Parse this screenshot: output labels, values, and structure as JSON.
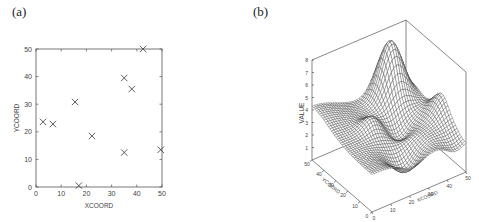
{
  "panels": {
    "a": {
      "label": "(a)"
    },
    "b": {
      "label": "(b)"
    }
  },
  "chart_data": [
    {
      "type": "scatter",
      "panel": "(a)",
      "title": "",
      "xlabel": "XCOORD",
      "ylabel": "YCOORD",
      "xlim": [
        0,
        50
      ],
      "ylim": [
        0,
        50
      ],
      "xticks": [
        "0",
        "10",
        "20",
        "30",
        "40",
        "50"
      ],
      "yticks": [
        "0",
        "10",
        "20",
        "30",
        "40",
        "50"
      ],
      "marker": "x",
      "grid": false,
      "points": [
        {
          "x": 2.8,
          "y": 23.6
        },
        {
          "x": 6.7,
          "y": 22.8
        },
        {
          "x": 15.5,
          "y": 30.8
        },
        {
          "x": 17.0,
          "y": 0.5
        },
        {
          "x": 22.2,
          "y": 18.5
        },
        {
          "x": 35.0,
          "y": 39.5
        },
        {
          "x": 35.0,
          "y": 12.5
        },
        {
          "x": 38.0,
          "y": 35.5
        },
        {
          "x": 42.5,
          "y": 50.0
        },
        {
          "x": 49.5,
          "y": 13.5
        }
      ]
    },
    {
      "type": "surface",
      "panel": "(b)",
      "title": "",
      "xlabel": "XCOORD",
      "ylabel": "YCOORD",
      "zlabel": "VALUE",
      "xlim": [
        0,
        50
      ],
      "ylim": [
        0,
        50
      ],
      "zlim": [
        0,
        8
      ],
      "xticks": [
        "0",
        "10",
        "20",
        "30",
        "40",
        "50"
      ],
      "yticks": [
        "0",
        "10",
        "20",
        "30",
        "40",
        "50"
      ],
      "zticks": [
        "1",
        "2",
        "3",
        "4",
        "5",
        "6",
        "7",
        "8"
      ],
      "description": "Interpolated wireframe surface of VALUE over the XCOORD-YCOORD grid; value ~4.3 at the (0,50) corner, peak ~8 near the back, low region ~1 near the front",
      "grid_resolution": 40
    }
  ]
}
